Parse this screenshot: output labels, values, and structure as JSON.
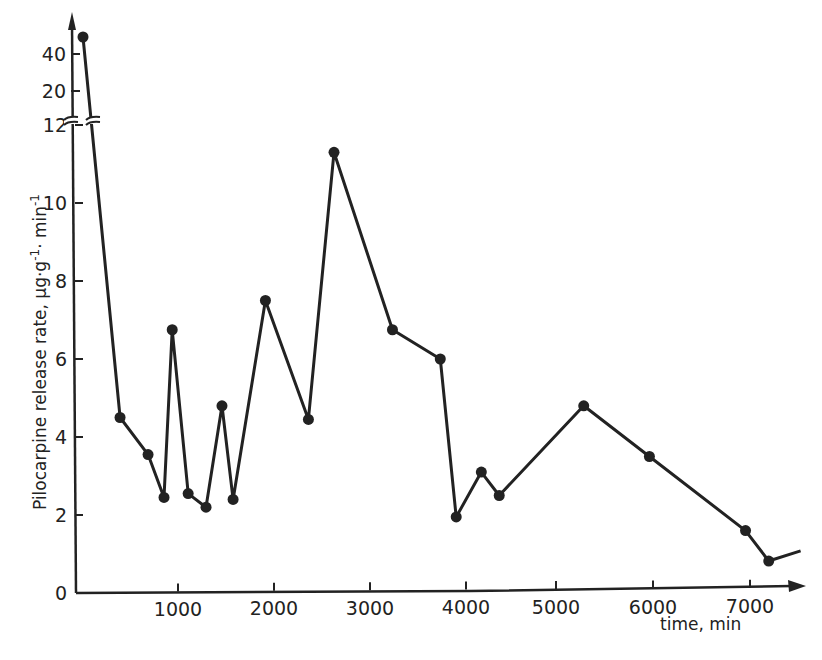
{
  "chart_data": {
    "type": "line",
    "title": "",
    "xlabel": "time, min",
    "ylabel": "Pilocarpine release rate, µg·g⁻¹·min⁻¹",
    "ylabel_parts": {
      "main": "Pilocarpine  release rate, µg·g",
      "sup1": "-1",
      "mid": "· min",
      "sup2": "-1"
    },
    "xlim": [
      0,
      7600
    ],
    "ylim": [
      0,
      12.5
    ],
    "y_break": {
      "lower_max": 12.5,
      "upper_ticks": [
        20,
        40
      ],
      "upper_max": 48
    },
    "x_ticks": [
      0,
      1000,
      2000,
      3000,
      4000,
      5000,
      6000,
      7000
    ],
    "x_tick_labels": [
      "0",
      "1000",
      "2000",
      "3000",
      "4000",
      "5000",
      "6000",
      "7000"
    ],
    "y_ticks": [
      0,
      2,
      4,
      6,
      8,
      10,
      12
    ],
    "y_tick_labels": [
      "0",
      "2",
      "4",
      "6",
      "8",
      "10",
      "12"
    ],
    "upper_tick_labels": [
      "20",
      "40"
    ],
    "grid": false,
    "legend": null,
    "series": [
      {
        "name": "Pilocarpine release rate",
        "marker": "filled-circle",
        "color": "#222222",
        "points": [
          {
            "x": 30,
            "y": 45
          },
          {
            "x": 425,
            "y": 4.5
          },
          {
            "x": 715,
            "y": 3.55
          },
          {
            "x": 880,
            "y": 2.45
          },
          {
            "x": 965,
            "y": 6.75
          },
          {
            "x": 1130,
            "y": 2.55
          },
          {
            "x": 1315,
            "y": 2.2
          },
          {
            "x": 1480,
            "y": 4.8
          },
          {
            "x": 1595,
            "y": 2.4
          },
          {
            "x": 1930,
            "y": 7.5
          },
          {
            "x": 2375,
            "y": 4.45
          },
          {
            "x": 2640,
            "y": 11.3
          },
          {
            "x": 3245,
            "y": 6.75
          },
          {
            "x": 3740,
            "y": 6.0
          },
          {
            "x": 3905,
            "y": 1.95
          },
          {
            "x": 4165,
            "y": 3.1
          },
          {
            "x": 4350,
            "y": 2.5
          },
          {
            "x": 5225,
            "y": 4.8
          },
          {
            "x": 5905,
            "y": 3.5
          },
          {
            "x": 6900,
            "y": 1.6
          },
          {
            "x": 7140,
            "y": 0.82
          }
        ],
        "tail_end": {
          "x": 7470,
          "y": 1.08
        }
      }
    ]
  }
}
